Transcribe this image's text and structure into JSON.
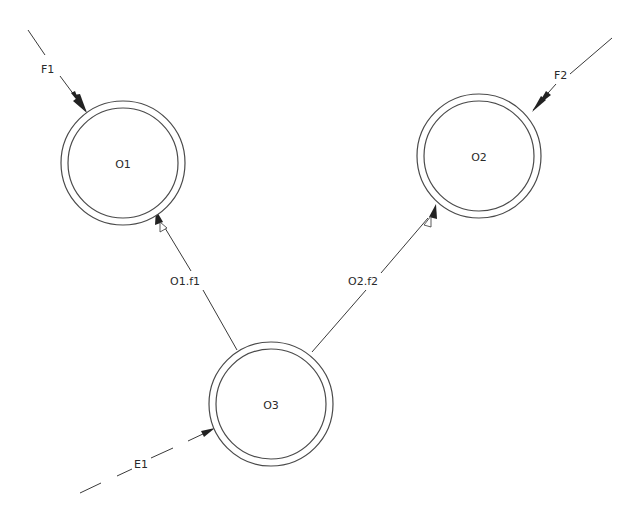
{
  "diagram": {
    "type": "object-communication-diagram",
    "nodes": [
      {
        "id": "O1",
        "label": "O1",
        "cx": 123,
        "cy": 163,
        "r_outer": 62,
        "r_inner": 55
      },
      {
        "id": "O2",
        "label": "O2",
        "cx": 479,
        "cy": 156,
        "r_outer": 62,
        "r_inner": 55
      },
      {
        "id": "O3",
        "label": "O3",
        "cx": 271,
        "cy": 404,
        "r_outer": 62,
        "r_inner": 55
      }
    ],
    "edges": [
      {
        "id": "F1",
        "label": "F1",
        "from": "external",
        "to": "O1",
        "style": "solid",
        "arrow": "filled"
      },
      {
        "id": "F2",
        "label": "F2",
        "from": "external",
        "to": "O2",
        "style": "solid",
        "arrow": "filled"
      },
      {
        "id": "O1.f1",
        "label": "O1.f1",
        "from": "O3",
        "to": "O1",
        "style": "solid",
        "arrow": "filled+open"
      },
      {
        "id": "O2.f2",
        "label": "O2.f2",
        "from": "O3",
        "to": "O2",
        "style": "solid",
        "arrow": "filled+open"
      },
      {
        "id": "E1",
        "label": "E1",
        "from": "external",
        "to": "O3",
        "style": "dashed",
        "arrow": "filled"
      }
    ],
    "colors": {
      "stroke": "#3a3a3a",
      "text": "#2a2a2a",
      "background": "#ffffff"
    }
  }
}
